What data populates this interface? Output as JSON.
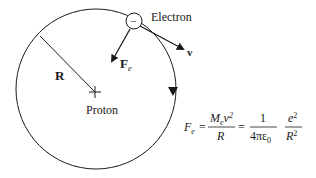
{
  "diagram": {
    "labels": {
      "electron": "Electron",
      "electron_sign": "−",
      "proton": "Proton",
      "radius": "R",
      "force": "F",
      "force_sub": "e",
      "velocity": "v"
    },
    "equation": {
      "lhs": "F",
      "lhs_sub": "e",
      "eq1": "=",
      "frac1_num": "M",
      "frac1_num_sub": "e",
      "frac1_num_var": "v",
      "frac1_num_exp": "2",
      "frac1_den": "R",
      "eq2": "=",
      "frac2_num": "1",
      "frac2_den": "4πε",
      "frac2_den_sub": "0",
      "frac3_num": "e",
      "frac3_num_exp": "2",
      "frac3_den": "R",
      "frac3_den_exp": "2"
    },
    "colors": {
      "stroke": "#1a1a1a",
      "background": "#ffffff"
    }
  }
}
